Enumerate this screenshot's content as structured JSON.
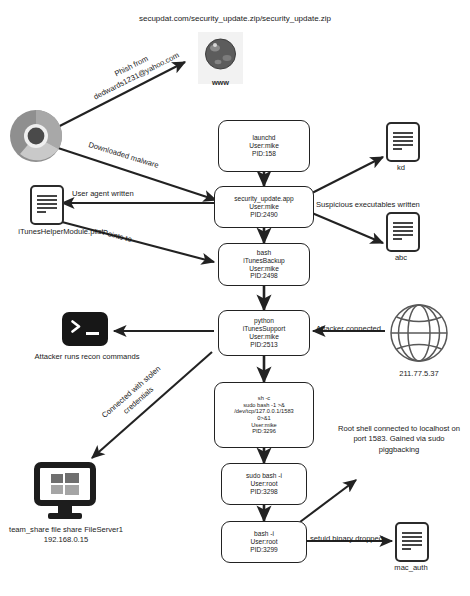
{
  "title_url": "secupdat.com/security_update.zip/security_update.zip",
  "icons": {
    "web": {
      "name": "www-globe-icon",
      "label": "www"
    },
    "browser": {
      "name": "chrome-browser-icon"
    },
    "terminal": {
      "name": "terminal-icon"
    },
    "internet": {
      "name": "globe-icon",
      "label": "211.77.5.37"
    },
    "fileserver": {
      "name": "windows-monitor-icon"
    }
  },
  "processes": [
    {
      "id": "launchd",
      "lines": [
        "launchd",
        "User:mike",
        "PID:158"
      ]
    },
    {
      "id": "security_update_app",
      "lines": [
        "security_update.app",
        "User:mike",
        "PID:2490"
      ]
    },
    {
      "id": "bash_itunesbackup",
      "lines": [
        "bash",
        "iTunesBackup",
        "User:mike",
        "PID:2498"
      ]
    },
    {
      "id": "python_itunessupport",
      "lines": [
        "python",
        "iTunesSupport",
        "User:mike",
        "PID:2513"
      ]
    },
    {
      "id": "sh_c",
      "lines": [
        "sh -c",
        "sudo bash -1 >&",
        "/dev/tcp/127.0.0.1/1583",
        "0>&1",
        "User:mike",
        "PID:3296"
      ]
    },
    {
      "id": "sudo_bash_i",
      "lines": [
        "sudo bash -i",
        "User:root",
        "PID:3298"
      ]
    },
    {
      "id": "bash_i",
      "lines": [
        "bash -i",
        "User:root",
        "PID:3299"
      ]
    }
  ],
  "files": [
    {
      "id": "kd",
      "label": "kd"
    },
    {
      "id": "abc",
      "label": "abc"
    },
    {
      "id": "plist",
      "label": "iTunesHelperModule.plist"
    },
    {
      "id": "mac_auth",
      "label": "mac_auth"
    }
  ],
  "edge_labels": {
    "phish": "Phish from\ndedwards1231@yahoo.com",
    "downloaded_malware": "Downloaded malware",
    "user_agent_written": "User agent written",
    "points_to": "Points to",
    "suspicious_executables": "Suspicious executables written",
    "attacker_connected": "Attacker connected",
    "connected_stolen": "Connected with stolen\ncredentials",
    "setuid_dropped": "setuid binary dropped"
  },
  "annotations": {
    "recon": "Attacker runs recon commands",
    "root_shell": "Root shell connected to localhost on port 1583. Gained via sudo piggbacking",
    "fileserver": "team_share file share\nFileServer1\n192.168.0.15"
  },
  "colors": {
    "stroke": "#222222",
    "text": "#1a1a1a",
    "node_fill": "#ffffff"
  }
}
